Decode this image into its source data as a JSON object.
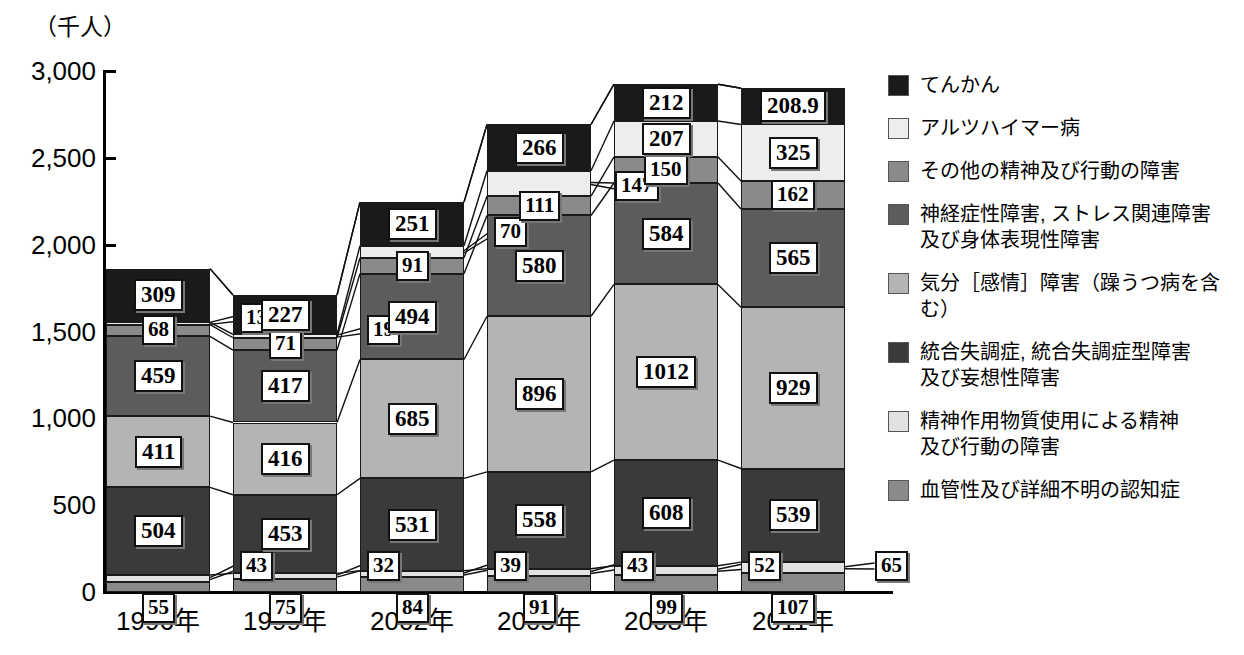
{
  "chart": {
    "type": "bar",
    "unit_label": "（千人）",
    "y_axis": {
      "ticks": [
        "3,000",
        "2,500",
        "2,000",
        "1,500",
        "1,000",
        "500",
        "0"
      ],
      "min": 0,
      "max": 3000
    },
    "x_axis": {
      "categories": [
        "1996年",
        "1999年",
        "2002年",
        "2005年",
        "2008年",
        "2011年"
      ]
    }
  },
  "chart_data": {
    "type": "bar",
    "title": "",
    "subtitle": "",
    "xlabel": "",
    "ylabel": "（千人）",
    "ylim": [
      0,
      3000
    ],
    "grid": false,
    "stacked": true,
    "legend_position": "right",
    "categories": [
      "1996年",
      "1999年",
      "2002年",
      "2005年",
      "2008年",
      "2011年"
    ],
    "series": [
      {
        "name": "血管性及び詳細不明の認知症",
        "color": "#8a8a8a",
        "values": [
          55,
          75,
          84,
          91,
          99,
          107
        ]
      },
      {
        "name": "精神作用物質使用による精神及び行動の障害",
        "color": "#e2e2e2",
        "values": [
          43,
          32,
          39,
          43,
          52,
          65
        ]
      },
      {
        "name": "統合失調症, 統合失調症型障害及び妄想性障害",
        "color": "#3a3a3a",
        "values": [
          504,
          453,
          531,
          558,
          608,
          539
        ]
      },
      {
        "name": "気分［感情］障害（躁うつ病を含む）",
        "color": "#b4b4b4",
        "values": [
          411,
          416,
          685,
          896,
          1012,
          929
        ]
      },
      {
        "name": "神経症性障害, ストレス関連障害及び身体表現性障害",
        "color": "#5c5c5c",
        "values": [
          459,
          417,
          494,
          580,
          584,
          565
        ]
      },
      {
        "name": "その他の精神及び行動の障害",
        "color": "#8a8a8a",
        "values": [
          68,
          71,
          91,
          111,
          150,
          162
        ]
      },
      {
        "name": "アルツハイマー病",
        "color": "#ededed",
        "values": [
          13,
          19,
          70,
          147,
          207,
          325
        ]
      },
      {
        "name": "てんかん",
        "color": "#1a1a1a",
        "values": [
          309,
          227,
          251,
          266,
          212,
          208.9
        ]
      }
    ],
    "totals": [
      1862,
      1710,
      2245,
      2692,
      2924,
      2900.9
    ],
    "value_labels": {
      "1996年": [
        "55",
        "43",
        "504",
        "411",
        "459",
        "68",
        "13",
        "309"
      ],
      "1999年": [
        "75",
        "32",
        "453",
        "416",
        "417",
        "71",
        "19",
        "227"
      ],
      "2002年": [
        "84",
        "39",
        "531",
        "685",
        "494",
        "91",
        "70",
        "251"
      ],
      "2005年": [
        "91",
        "43",
        "558",
        "896",
        "580",
        "111",
        "147",
        "266"
      ],
      "2008年": [
        "99",
        "52",
        "608",
        "1012",
        "584",
        "150",
        "207",
        "212"
      ],
      "2011年": [
        "107",
        "65",
        "539",
        "929",
        "565",
        "162",
        "325",
        "208.9"
      ]
    }
  },
  "legend": {
    "items": [
      {
        "label": "てんかん",
        "color": "#1a1a1a"
      },
      {
        "label": "アルツハイマー病",
        "color": "#ededed"
      },
      {
        "label": "その他の精神及び行動の障害",
        "color": "#8a8a8a"
      },
      {
        "label": "神経症性障害, ストレス関連障害\n及び身体表現性障害",
        "color": "#5c5c5c"
      },
      {
        "label": "気分［感情］障害（躁うつ病を含む）",
        "color": "#b4b4b4"
      },
      {
        "label": "統合失調症, 統合失調症型障害\n及び妄想性障害",
        "color": "#3a3a3a"
      },
      {
        "label": "精神作用物質使用による精神\n及び行動の障害",
        "color": "#e2e2e2"
      },
      {
        "label": "血管性及び詳細不明の認知症",
        "color": "#8a8a8a"
      }
    ]
  }
}
